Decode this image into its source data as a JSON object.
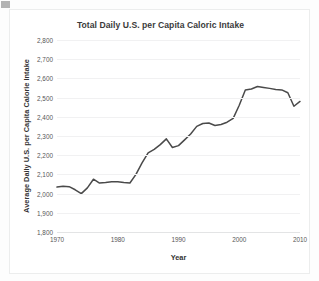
{
  "chart_data": {
    "type": "line",
    "title": "Total Daily U.S. per Capita Caloric Intake",
    "xlabel": "Year",
    "ylabel": "Average Daily U.S. per Capita Calorie Intake",
    "xlim": [
      1970,
      2010
    ],
    "ylim": [
      1800,
      2800
    ],
    "xticks": [
      1970,
      1980,
      1990,
      2000,
      2010
    ],
    "xtick_labels": [
      "1970",
      "1980",
      "1990",
      "2000",
      "2010"
    ],
    "yticks": [
      1800,
      1900,
      2000,
      2100,
      2200,
      2300,
      2400,
      2500,
      2600,
      2700,
      2800
    ],
    "ytick_labels": [
      "1,800",
      "1,900",
      "2,000",
      "2,100",
      "2,200",
      "2,300",
      "2,400",
      "2,500",
      "2,600",
      "2,700",
      "2,800"
    ],
    "grid": true,
    "legend": "none",
    "line_color": "#4a4a4a",
    "x": [
      1970,
      1971,
      1972,
      1973,
      1974,
      1975,
      1976,
      1977,
      1978,
      1979,
      1980,
      1981,
      1982,
      1983,
      1984,
      1985,
      1986,
      1987,
      1988,
      1989,
      1990,
      1991,
      1992,
      1993,
      1994,
      1995,
      1996,
      1997,
      1998,
      1999,
      2000,
      2001,
      2002,
      2003,
      2004,
      2005,
      2006,
      2007,
      2008,
      2009,
      2010
    ],
    "series": [
      {
        "name": "Average Daily U.S. per Capita Calorie Intake",
        "values": [
          2034,
          2038,
          2036,
          2020,
          2000,
          2030,
          2075,
          2055,
          2058,
          2062,
          2062,
          2058,
          2055,
          2100,
          2160,
          2212,
          2230,
          2255,
          2285,
          2240,
          2250,
          2280,
          2310,
          2350,
          2365,
          2368,
          2355,
          2360,
          2372,
          2392,
          2460,
          2540,
          2545,
          2558,
          2553,
          2548,
          2542,
          2540,
          2525,
          2455,
          2480
        ]
      }
    ]
  },
  "figure": {
    "axis_tick_text_color": "#575757",
    "grid_color": "#f1f1f2",
    "background": "#ffffff"
  }
}
